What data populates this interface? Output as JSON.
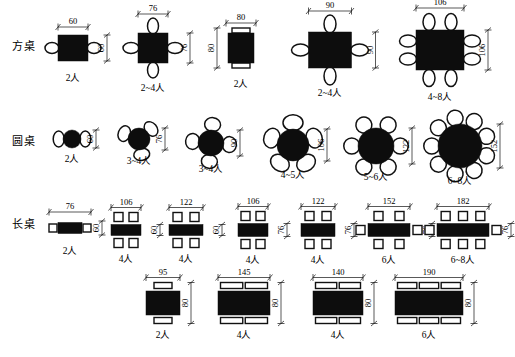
{
  "figure": {
    "title_caption": "",
    "rows": [
      {
        "id": "square",
        "label": "方桌",
        "items": [
          {
            "width": "60",
            "depth": "60",
            "capacity": "2人",
            "chairs": "2",
            "chair_shape": "oval",
            "table_shape": "square"
          },
          {
            "width": "76",
            "depth": "76",
            "capacity": "2~4人",
            "chairs": "4",
            "chair_shape": "oval",
            "table_shape": "square"
          },
          {
            "width": "80",
            "depth": "80",
            "capacity": "2人",
            "chairs": "2",
            "chair_shape": "rect",
            "table_shape": "square"
          },
          {
            "width": "90",
            "depth": "90",
            "capacity": "2~4人",
            "chairs": "4",
            "chair_shape": "oval",
            "table_shape": "square"
          },
          {
            "width": "106",
            "depth": "106",
            "capacity": "4~8人",
            "chairs": "8",
            "chair_shape": "oval",
            "table_shape": "square"
          }
        ]
      },
      {
        "id": "round",
        "label": "圆桌",
        "items": [
          {
            "diameter": "60",
            "capacity": "2人",
            "chairs": "2",
            "table_shape": "circle"
          },
          {
            "diameter": "76",
            "capacity": "3~4人",
            "chairs": "3",
            "table_shape": "circle"
          },
          {
            "diameter": "90",
            "capacity": "3~4人",
            "chairs": "4",
            "table_shape": "circle"
          },
          {
            "diameter": "106",
            "capacity": "4~5人",
            "chairs": "5",
            "table_shape": "circle"
          },
          {
            "diameter": "122",
            "capacity": "5~6人",
            "chairs": "6",
            "table_shape": "circle"
          },
          {
            "diameter": "152",
            "capacity": "6~8人",
            "chairs": "8",
            "table_shape": "circle"
          }
        ]
      },
      {
        "id": "long_top",
        "label": "长桌",
        "items": [
          {
            "width": "76",
            "depth": "60",
            "capacity": "2人",
            "chairs_side": "0",
            "chairs_end": "2",
            "table_shape": "rect"
          },
          {
            "width": "106",
            "depth": "60",
            "capacity": "4人",
            "chairs_side": "2",
            "chairs_end": "0",
            "table_shape": "rect"
          },
          {
            "width": "122",
            "depth": "60",
            "capacity": "4人",
            "chairs_side": "2",
            "chairs_end": "0",
            "table_shape": "rect"
          },
          {
            "width": "106",
            "depth": "76",
            "capacity": "4人",
            "chairs_side": "2",
            "chairs_end": "0",
            "table_shape": "rect"
          },
          {
            "width": "122",
            "depth": "76",
            "capacity": "4人",
            "chairs_side": "2",
            "chairs_end": "0",
            "table_shape": "rect"
          },
          {
            "width": "152",
            "depth": "76",
            "capacity": "6人",
            "chairs_side": "2",
            "chairs_end": "2",
            "table_shape": "rect"
          },
          {
            "width": "182",
            "depth": "76",
            "capacity": "6~8人",
            "chairs_side": "3",
            "chairs_end": "2",
            "table_shape": "rect"
          }
        ]
      },
      {
        "id": "long_bottom",
        "label": "",
        "items": [
          {
            "width": "95",
            "depth": "80",
            "capacity": "2人",
            "chairs_side": "1",
            "chairs_end": "0",
            "table_shape": "rect"
          },
          {
            "width": "145",
            "depth": "80",
            "capacity": "4人",
            "chairs_side": "2",
            "chairs_end": "0",
            "table_shape": "rect"
          },
          {
            "width": "140",
            "depth": "80",
            "capacity": "4人",
            "chairs_side": "2",
            "chairs_end": "0",
            "table_shape": "rect"
          },
          {
            "width": "190",
            "depth": "80",
            "capacity": "6人",
            "chairs_side": "3",
            "chairs_end": "0",
            "table_shape": "rect"
          }
        ]
      }
    ]
  },
  "colors": {
    "table_fill": "#0d0d0d",
    "chair_fill": "#ffffff",
    "line": "#111111",
    "background": "#ffffff"
  }
}
